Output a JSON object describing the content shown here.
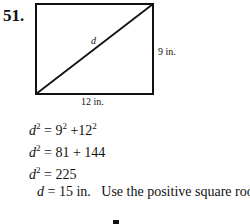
{
  "problem": {
    "number": "51.",
    "figure": {
      "shape": "rectangle",
      "diagonal_label": "d",
      "height_label": "9 in.",
      "width_label": "12 in."
    },
    "steps": [
      {
        "lhs_var": "d",
        "lhs_exp": "2",
        "rhs_a": "9",
        "rhs_a_exp": "2",
        "op": "+",
        "rhs_b": "12",
        "rhs_b_exp": "2"
      },
      {
        "lhs_var": "d",
        "lhs_exp": "2",
        "rhs": "81 + 144"
      },
      {
        "lhs_var": "d",
        "lhs_exp": "2",
        "rhs": "225"
      },
      {
        "lhs_var": "d",
        "rhs": "15 in.",
        "note": "Use the positive square root."
      }
    ]
  }
}
